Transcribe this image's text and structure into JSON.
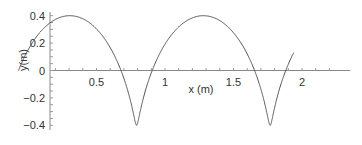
{
  "chart_data": {
    "type": "line",
    "title": "",
    "xlabel": "x (m)",
    "ylabel": "y(m)",
    "xlim": [
      0.17,
      2.35
    ],
    "ylim": [
      -0.4,
      0.4
    ],
    "grid": false,
    "legend": null,
    "x_ticks": [
      "0.5",
      "1",
      "1.5",
      "2"
    ],
    "y_ticks": [
      "0.4",
      "0.2",
      "0",
      "−0.2",
      "−0.4"
    ],
    "series": [
      {
        "name": "trajectory",
        "description": "prolate trochoid with two loops",
        "x": [
          0.45,
          0.43,
          0.38,
          0.31,
          0.27,
          0.25,
          0.27,
          0.35,
          0.5,
          0.7,
          0.9,
          1.05,
          1.15,
          1.2,
          1.22,
          1.25,
          1.3,
          1.34,
          1.33,
          1.3,
          1.26,
          1.35,
          1.5,
          1.7,
          1.9,
          2.05,
          2.18,
          2.25
        ],
        "y": [
          0.0,
          0.2,
          0.35,
          0.4,
          0.3,
          0.15,
          0.0,
          -0.17,
          -0.3,
          -0.38,
          -0.38,
          -0.3,
          -0.15,
          0.1,
          0.3,
          0.4,
          0.35,
          0.15,
          0.0,
          -0.1,
          -0.12,
          -0.25,
          -0.36,
          -0.4,
          -0.35,
          -0.22,
          -0.07,
          0.0
        ]
      }
    ],
    "color": "#555555"
  }
}
